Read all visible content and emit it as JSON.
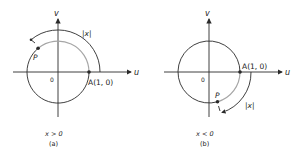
{
  "figures": [
    {
      "id": "a",
      "axis_u_label": "u",
      "axis_v_label": "v",
      "origin_label": "0",
      "point_a_label": "A(1, 0)",
      "point_p_label": "P",
      "arc_label": "|x|",
      "condition": "x > 0",
      "caption": "(a)"
    },
    {
      "id": "b",
      "axis_u_label": "u",
      "axis_v_label": "v",
      "origin_label": "0",
      "point_a_label": "A(1, 0)",
      "point_p_label": "P",
      "arc_label": "|x|",
      "condition": "x < 0",
      "caption": "(b)"
    }
  ],
  "colors": {
    "line": "#2a2a2a",
    "gray_arc": "#a6a6a6",
    "text": "#222222"
  }
}
